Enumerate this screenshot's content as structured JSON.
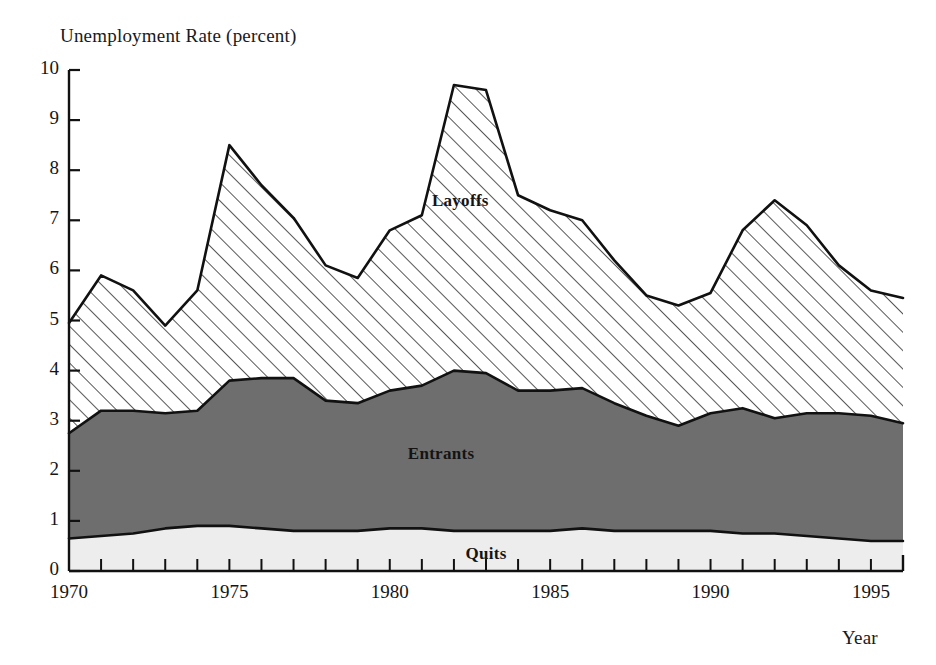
{
  "chart_data": {
    "type": "area",
    "title": "",
    "ylabel": "Unemployment Rate (percent)",
    "xlabel": "Year",
    "ylim": [
      0,
      10
    ],
    "xlim": [
      1970,
      1996
    ],
    "grid": false,
    "legend_position": "inline-labels",
    "y_ticks": [
      "0",
      "1",
      "2",
      "3",
      "4",
      "5",
      "6",
      "7",
      "8",
      "9",
      "10"
    ],
    "x_ticks": [
      "1970",
      "1975",
      "1980",
      "1985",
      "1990",
      "1995"
    ],
    "x_tick_step_minor": 1,
    "x": [
      1970,
      1971,
      1972,
      1973,
      1974,
      1975,
      1976,
      1977,
      1978,
      1979,
      1980,
      1981,
      1982,
      1983,
      1984,
      1985,
      1986,
      1987,
      1988,
      1989,
      1990,
      1991,
      1992,
      1993,
      1994,
      1995,
      1996
    ],
    "stacked": true,
    "stack_order_bottom_to_top": [
      "Quits",
      "Entrants",
      "Layoffs"
    ],
    "series": [
      {
        "name": "Quits",
        "fill": "#ededed",
        "pattern": "solid-light",
        "values": [
          0.65,
          0.7,
          0.75,
          0.85,
          0.9,
          0.9,
          0.85,
          0.8,
          0.8,
          0.8,
          0.85,
          0.85,
          0.8,
          0.8,
          0.8,
          0.8,
          0.85,
          0.8,
          0.8,
          0.8,
          0.8,
          0.75,
          0.75,
          0.7,
          0.65,
          0.6,
          0.6
        ]
      },
      {
        "name": "Entrants",
        "fill": "#6e6e6e",
        "pattern": "solid-gray",
        "values": [
          2.1,
          2.5,
          2.45,
          2.3,
          2.3,
          2.9,
          3.0,
          3.05,
          2.6,
          2.55,
          2.75,
          2.85,
          3.2,
          3.15,
          2.8,
          2.8,
          2.8,
          2.55,
          2.3,
          2.1,
          2.35,
          2.5,
          2.3,
          2.45,
          2.5,
          2.5,
          2.35
        ]
      },
      {
        "name": "Layoffs",
        "fill": "#ffffff",
        "pattern": "diagonal-hatch",
        "values": [
          2.2,
          2.7,
          2.4,
          1.75,
          2.4,
          4.7,
          3.85,
          3.2,
          2.7,
          2.5,
          3.2,
          3.4,
          5.7,
          5.65,
          3.9,
          3.6,
          3.35,
          2.85,
          2.4,
          2.4,
          2.4,
          3.55,
          4.35,
          3.75,
          2.95,
          2.5,
          2.5
        ]
      }
    ],
    "cumulative_tops": {
      "quits_line": [
        0.65,
        0.7,
        0.75,
        0.85,
        0.9,
        0.9,
        0.85,
        0.8,
        0.8,
        0.8,
        0.85,
        0.85,
        0.8,
        0.8,
        0.8,
        0.8,
        0.85,
        0.8,
        0.8,
        0.8,
        0.8,
        0.75,
        0.75,
        0.7,
        0.65,
        0.6,
        0.6
      ],
      "entrants_line": [
        2.75,
        3.2,
        3.2,
        3.15,
        3.2,
        3.8,
        3.85,
        3.85,
        3.4,
        3.35,
        3.6,
        3.7,
        4.0,
        3.95,
        3.6,
        3.6,
        3.65,
        3.35,
        3.1,
        2.9,
        3.15,
        3.25,
        3.05,
        3.15,
        3.15,
        3.1,
        2.95
      ],
      "total_line": [
        4.95,
        5.9,
        5.6,
        4.9,
        5.6,
        8.5,
        7.7,
        7.05,
        6.1,
        5.85,
        6.8,
        7.1,
        9.7,
        9.6,
        7.5,
        7.2,
        7.0,
        6.2,
        5.5,
        5.3,
        5.55,
        6.8,
        7.4,
        6.9,
        6.1,
        5.6,
        5.45
      ]
    },
    "annotations": [
      {
        "text": "Layoffs",
        "x": 1982.2,
        "y": 7.35
      },
      {
        "text": "Entrants",
        "x": 1981.6,
        "y": 2.3
      },
      {
        "text": "Quits",
        "x": 1983.0,
        "y": 0.3
      }
    ]
  }
}
